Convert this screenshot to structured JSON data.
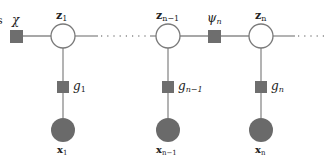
{
  "diagram": {
    "type": "factor-graph",
    "colors": {
      "edge": "#8a8a8a",
      "factor": "#6e6e6e",
      "latent_fill": "#ffffff",
      "latent_stroke": "#7a7a7a",
      "observed_fill": "#6a6a6a",
      "label": "#222222"
    },
    "clipped_left_label": "s",
    "factors": {
      "chi": {
        "label": "χ"
      },
      "psi_n": {
        "label": "ψ",
        "sub": "n"
      },
      "g1": {
        "label": "g",
        "sub": "1"
      },
      "g_n_minus_1": {
        "label": "g",
        "sub": "n−1"
      },
      "g_n": {
        "label": "g",
        "sub": "n"
      }
    },
    "latent_nodes": {
      "z1": {
        "label": "z",
        "sub": "1"
      },
      "z_n_minus_1": {
        "label": "z",
        "sub": "n−1"
      },
      "z_n": {
        "label": "z",
        "sub": "n"
      }
    },
    "observed_nodes": {
      "x1": {
        "label": "x",
        "sub": "1"
      },
      "x_n_minus_1": {
        "label": "x",
        "sub": "n−1"
      },
      "x_n": {
        "label": "x",
        "sub": "n"
      }
    },
    "ellipsis": "· · · · · ·"
  }
}
